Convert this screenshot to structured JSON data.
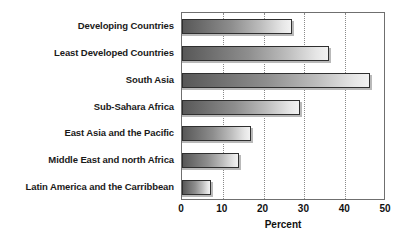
{
  "chart_data": {
    "type": "bar",
    "orientation": "horizontal",
    "title": "",
    "xlabel": "Percent",
    "ylabel": "",
    "categories": [
      "Developing Countries",
      "Least Developed Countries",
      "South Asia",
      "Sub-Sahara Africa",
      "East Asia and the Pacific",
      "Middle East and north Africa",
      "Latin America and the Carribbean"
    ],
    "values": [
      27,
      36,
      46,
      29,
      17,
      14,
      7
    ],
    "xlim": [
      0,
      50
    ],
    "xticks": [
      0,
      10,
      20,
      30,
      40,
      50
    ],
    "xtick_labels": [
      "0",
      "10",
      "20",
      "30",
      "40",
      "50"
    ],
    "grid": "vertical-dotted",
    "legend": "none",
    "bar_gradient_from": "#585858",
    "bar_gradient_to": "#f2f2f2",
    "bar_border_color": "#2f2f2f",
    "axis_color": "#6f6f6f"
  }
}
